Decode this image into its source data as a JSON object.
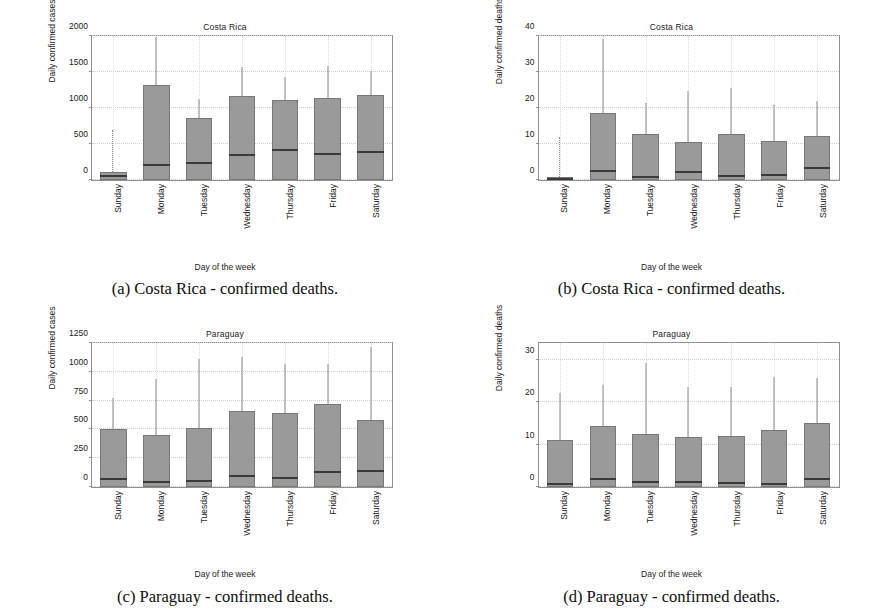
{
  "document": {
    "kind": "figure-panel",
    "panel_count": 4
  },
  "shared": {
    "xlabel": "Day of the week",
    "categories": [
      "Sunday",
      "Monday",
      "Tuesday",
      "Wednesday",
      "Thursday",
      "Friday",
      "Saturday"
    ],
    "box_fill": "#9a9a9a",
    "median_color": "#3a3a3a",
    "axis_color": "#8f8f8f",
    "grid": true
  },
  "panels": [
    {
      "tag": "a",
      "caption": "(a) Costa Rica - confirmed deaths.",
      "chart_data": {
        "type": "box",
        "title": "Costa Rica",
        "xlabel": "Day of the week",
        "ylabel": "Daily confirmed cases",
        "ylim": [
          0,
          2000
        ],
        "yticks": [
          0,
          500,
          1000,
          1500,
          2000
        ],
        "categories": [
          "Sunday",
          "Monday",
          "Tuesday",
          "Wednesday",
          "Thursday",
          "Friday",
          "Saturday"
        ],
        "boxes": [
          {
            "category": "Sunday",
            "q1": 0,
            "median": 60,
            "q3": 110,
            "whisker_low": 0,
            "whisker_high": 110,
            "outliers_top": 700
          },
          {
            "category": "Monday",
            "q1": 0,
            "median": 205,
            "q3": 1325,
            "whisker_low": 0,
            "whisker_high": 1985,
            "outliers_top": 0
          },
          {
            "category": "Tuesday",
            "q1": 0,
            "median": 230,
            "q3": 855,
            "whisker_low": 0,
            "whisker_high": 1120,
            "outliers_top": 0
          },
          {
            "category": "Wednesday",
            "q1": 0,
            "median": 350,
            "q3": 1160,
            "whisker_low": 0,
            "whisker_high": 1565,
            "outliers_top": 0
          },
          {
            "category": "Thursday",
            "q1": 0,
            "median": 420,
            "q3": 1105,
            "whisker_low": 0,
            "whisker_high": 1425,
            "outliers_top": 0
          },
          {
            "category": "Friday",
            "q1": 0,
            "median": 360,
            "q3": 1140,
            "whisker_low": 0,
            "whisker_high": 1590,
            "outliers_top": 0
          },
          {
            "category": "Saturday",
            "q1": 0,
            "median": 390,
            "q3": 1175,
            "whisker_low": 0,
            "whisker_high": 1520,
            "outliers_top": 0
          }
        ]
      }
    },
    {
      "tag": "b",
      "caption": "(b) Costa Rica - confirmed deaths.",
      "chart_data": {
        "type": "box",
        "title": "Costa Rica",
        "xlabel": "Day of the week",
        "ylabel": "Daily confirmed deaths",
        "ylim": [
          0,
          40
        ],
        "yticks": [
          0,
          10,
          20,
          30,
          40
        ],
        "categories": [
          "Sunday",
          "Monday",
          "Tuesday",
          "Wednesday",
          "Thursday",
          "Friday",
          "Saturday"
        ],
        "boxes": [
          {
            "category": "Sunday",
            "q1": 0,
            "median": 0.4,
            "q3": 0.8,
            "whisker_low": 0,
            "whisker_high": 0.8,
            "outliers_top": 12
          },
          {
            "category": "Monday",
            "q1": 0,
            "median": 2.6,
            "q3": 18.6,
            "whisker_low": 0,
            "whisker_high": 39.3,
            "outliers_top": 0
          },
          {
            "category": "Tuesday",
            "q1": 0,
            "median": 0.7,
            "q3": 12.8,
            "whisker_low": 0,
            "whisker_high": 21.3,
            "outliers_top": 0
          },
          {
            "category": "Wednesday",
            "q1": 0,
            "median": 2.1,
            "q3": 10.6,
            "whisker_low": 0,
            "whisker_high": 24.6,
            "outliers_top": 0
          },
          {
            "category": "Thursday",
            "q1": 0,
            "median": 1.2,
            "q3": 12.9,
            "whisker_low": 0,
            "whisker_high": 25.6,
            "outliers_top": 0
          },
          {
            "category": "Friday",
            "q1": 0,
            "median": 1.4,
            "q3": 10.9,
            "whisker_low": 0,
            "whisker_high": 20.8,
            "outliers_top": 0
          },
          {
            "category": "Saturday",
            "q1": 0,
            "median": 3.2,
            "q3": 12.1,
            "whisker_low": 0,
            "whisker_high": 22.0,
            "outliers_top": 0
          }
        ]
      }
    },
    {
      "tag": "c",
      "caption": "(c) Paraguay - confirmed deaths.",
      "chart_data": {
        "type": "box",
        "title": "Paraguay",
        "xlabel": "Day of the week",
        "ylabel": "Daily confirmed cases",
        "ylim": [
          0,
          1250
        ],
        "yticks": [
          0,
          250,
          500,
          750,
          1000,
          1250
        ],
        "categories": [
          "Sunday",
          "Monday",
          "Tuesday",
          "Wednesday",
          "Thursday",
          "Friday",
          "Saturday"
        ],
        "boxes": [
          {
            "category": "Sunday",
            "q1": 0,
            "median": 72,
            "q3": 505,
            "whisker_low": 0,
            "whisker_high": 772,
            "outliers_top": 0
          },
          {
            "category": "Monday",
            "q1": 0,
            "median": 40,
            "q3": 455,
            "whisker_low": 0,
            "whisker_high": 940,
            "outliers_top": 0
          },
          {
            "category": "Tuesday",
            "q1": 0,
            "median": 50,
            "q3": 510,
            "whisker_low": 0,
            "whisker_high": 1115,
            "outliers_top": 0
          },
          {
            "category": "Wednesday",
            "q1": 0,
            "median": 95,
            "q3": 662,
            "whisker_low": 0,
            "whisker_high": 1130,
            "outliers_top": 0
          },
          {
            "category": "Thursday",
            "q1": 0,
            "median": 82,
            "q3": 645,
            "whisker_low": 0,
            "whisker_high": 1070,
            "outliers_top": 0
          },
          {
            "category": "Friday",
            "q1": 0,
            "median": 130,
            "q3": 722,
            "whisker_low": 0,
            "whisker_high": 1065,
            "outliers_top": 0
          },
          {
            "category": "Saturday",
            "q1": 0,
            "median": 140,
            "q3": 580,
            "whisker_low": 0,
            "whisker_high": 1215,
            "outliers_top": 0
          }
        ]
      }
    },
    {
      "tag": "d",
      "caption": "(d) Paraguay - confirmed deaths.",
      "chart_data": {
        "type": "box",
        "title": "Paraguay",
        "xlabel": "Day of the week",
        "ylabel": "Daily confirmed deaths",
        "ylim": [
          0,
          34
        ],
        "yticks": [
          0,
          10,
          20,
          30
        ],
        "categories": [
          "Sunday",
          "Monday",
          "Tuesday",
          "Wednesday",
          "Thursday",
          "Friday",
          "Saturday"
        ],
        "boxes": [
          {
            "category": "Sunday",
            "q1": 0,
            "median": 0.6,
            "q3": 11.2,
            "whisker_low": 0,
            "whisker_high": 22.3,
            "outliers_top": 0
          },
          {
            "category": "Monday",
            "q1": 0,
            "median": 2.0,
            "q3": 14.3,
            "whisker_low": 0,
            "whisker_high": 24.2,
            "outliers_top": 0
          },
          {
            "category": "Tuesday",
            "q1": 0,
            "median": 1.2,
            "q3": 12.6,
            "whisker_low": 0,
            "whisker_high": 29.4,
            "outliers_top": 0
          },
          {
            "category": "Wednesday",
            "q1": 0,
            "median": 1.1,
            "q3": 11.8,
            "whisker_low": 0,
            "whisker_high": 23.5,
            "outliers_top": 0
          },
          {
            "category": "Thursday",
            "q1": 0,
            "median": 0.9,
            "q3": 12.0,
            "whisker_low": 0,
            "whisker_high": 23.7,
            "outliers_top": 0
          },
          {
            "category": "Friday",
            "q1": 0,
            "median": 0.8,
            "q3": 13.4,
            "whisker_low": 0,
            "whisker_high": 25.9,
            "outliers_top": 0
          },
          {
            "category": "Saturday",
            "q1": 0,
            "median": 1.9,
            "q3": 15.0,
            "whisker_low": 0,
            "whisker_high": 25.8,
            "outliers_top": 0
          }
        ]
      }
    }
  ]
}
